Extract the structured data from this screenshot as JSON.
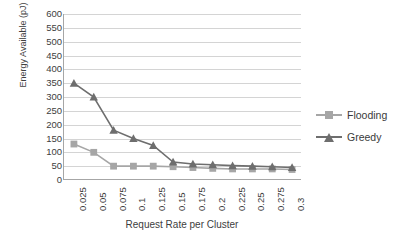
{
  "chart_data": {
    "type": "line",
    "title": "",
    "xlabel": "Request Rate per Cluster",
    "ylabel": "Energy Available (pJ)",
    "x": [
      "0.025",
      "0.05",
      "0.075",
      "0.1",
      "0.125",
      "0.15",
      "0.175",
      "0.2",
      "0.225",
      "0.25",
      "0.275",
      "0.3"
    ],
    "categories": [
      "0.025",
      "0.05",
      "0.075",
      "0.1",
      "0.125",
      "0.15",
      "0.175",
      "0.2",
      "0.225",
      "0.25",
      "0.275",
      "0.3"
    ],
    "series": [
      {
        "name": "Flooding",
        "color": "#a6a6a6",
        "marker": "square",
        "values": [
          130,
          100,
          50,
          50,
          50,
          48,
          45,
          42,
          40,
          40,
          40,
          38
        ]
      },
      {
        "name": "Greedy",
        "color": "#6e6e6e",
        "marker": "triangle",
        "values": [
          350,
          300,
          180,
          150,
          125,
          65,
          58,
          55,
          52,
          50,
          48,
          45
        ]
      }
    ],
    "ylim": [
      0,
      600
    ],
    "ytick_step": 50,
    "yticks": [
      "600",
      "550",
      "500",
      "450",
      "400",
      "350",
      "300",
      "250",
      "200",
      "150",
      "100",
      "50",
      "0"
    ],
    "grid": "horizontal",
    "legend_position": "right"
  },
  "legend": {
    "items": [
      {
        "label": "Flooding"
      },
      {
        "label": "Greedy"
      }
    ]
  },
  "colors": {
    "flooding": "#a6a6a6",
    "greedy": "#6e6e6e",
    "gridline": "#d4d4d4",
    "axis": "#a6a6a6",
    "text": "#404040"
  }
}
